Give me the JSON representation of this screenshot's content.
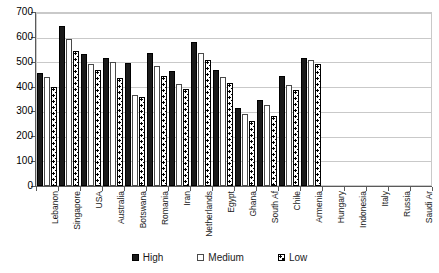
{
  "chart_data": {
    "type": "bar",
    "title": "",
    "subtitle": "",
    "xlabel": "",
    "ylabel": "",
    "ylim": [
      0,
      700
    ],
    "ytick_step": 100,
    "yticks": [
      0,
      100,
      200,
      300,
      400,
      500,
      600,
      700
    ],
    "grid": true,
    "legend_position": "bottom",
    "categories": [
      "Lebanon",
      "Singapore",
      "USA",
      "Australia",
      "Botswana",
      "Romania",
      "Iran",
      "Netherlands",
      "Egypt",
      "Ghana",
      "South Af",
      "Chile",
      "Armenia",
      "Hungary",
      "Indonesia",
      "Italy",
      "Russia",
      "Saudi Ar"
    ],
    "series": [
      {
        "name": "High",
        "values": [
          455,
          645,
          533,
          517,
          495,
          534,
          463,
          580,
          468,
          313,
          345,
          444,
          515,
          null,
          null,
          null,
          null,
          null
        ]
      },
      {
        "name": "Medium",
        "values": [
          440,
          590,
          490,
          497,
          367,
          483,
          409,
          537,
          437,
          288,
          327,
          408,
          505,
          null,
          null,
          null,
          null,
          null
        ]
      },
      {
        "name": "Low",
        "values": [
          400,
          545,
          468,
          434,
          357,
          442,
          391,
          505,
          413,
          262,
          281,
          385,
          490,
          null,
          null,
          null,
          null,
          null
        ]
      }
    ]
  },
  "legend": {
    "items": [
      {
        "label": "High",
        "style": "solid-black",
        "color": "#1a1a1a"
      },
      {
        "label": "Medium",
        "style": "hollow-white",
        "color": "#ffffff"
      },
      {
        "label": "Low",
        "style": "dotted-pattern",
        "color": "#ffffff"
      }
    ]
  },
  "axes": {
    "y_tick_labels": [
      "700",
      "600",
      "500",
      "400",
      "300",
      "200",
      "100",
      "0"
    ]
  }
}
